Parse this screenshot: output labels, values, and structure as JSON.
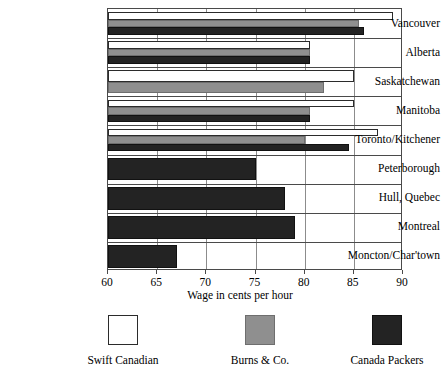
{
  "chart_data": {
    "type": "bar",
    "orientation": "horizontal",
    "title": "",
    "xlabel": "Wage in cents per hour",
    "ylabel": "",
    "xlim": [
      60,
      90
    ],
    "xticks": [
      60,
      65,
      70,
      75,
      80,
      85,
      90
    ],
    "xtick_labels": [
      "60",
      "65",
      "70",
      "75",
      "80",
      "85",
      "90"
    ],
    "grid": true,
    "legend_position": "bottom",
    "categories": [
      "Vancouver",
      "Alberta",
      "Saskatchewan",
      "Manitoba",
      "Toronto/Kitchener",
      "Peterborough",
      "Hull, Quebec",
      "Montreal",
      "Moncton/Char'town"
    ],
    "series": [
      {
        "name": "Swift Canadian",
        "color": "#ffffff",
        "values": [
          89.0,
          80.5,
          85.0,
          85.0,
          87.5,
          null,
          null,
          null,
          null
        ]
      },
      {
        "name": "Burns & Co.",
        "color": "#8f8f8f",
        "values": [
          85.5,
          80.5,
          82.0,
          80.5,
          80.0,
          null,
          null,
          null,
          null
        ]
      },
      {
        "name": "Canada Packers",
        "color": "#232323",
        "values": [
          86.0,
          80.5,
          null,
          80.5,
          84.5,
          75.0,
          78.0,
          79.0,
          67.0
        ]
      }
    ]
  },
  "legend": {
    "items": [
      {
        "label": "Swift Canadian",
        "swatch": "swift"
      },
      {
        "label": "Burns & Co.",
        "swatch": "burns"
      },
      {
        "label": "Canada Packers",
        "swatch": "packers"
      }
    ]
  }
}
